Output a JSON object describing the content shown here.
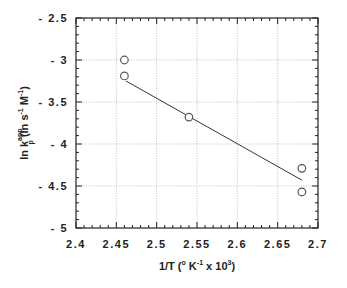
{
  "chart_data": {
    "type": "scatter",
    "title": "",
    "xlabel": "1/T (° K^-1 x 10^3)",
    "ylabel": "ln k_p^app (ln s^-1 M^-1)",
    "xlim": [
      2.4,
      2.7
    ],
    "ylim": [
      -5,
      -2.5
    ],
    "x_ticks": [
      2.4,
      2.45,
      2.5,
      2.55,
      2.6,
      2.65,
      2.7
    ],
    "x_tick_labels": [
      "2.4",
      "2.45",
      "2.5",
      "2.55",
      "2.6",
      "2.65",
      "2.7"
    ],
    "y_ticks": [
      -2.5,
      -3,
      -3.5,
      -4,
      -4.5,
      -5
    ],
    "y_tick_labels": [
      "- 2.5",
      "- 3",
      "- 3.5",
      "- 4",
      "- 4.5",
      "- 5"
    ],
    "grid": true,
    "legend": null,
    "series": [
      {
        "name": "data",
        "marker": "open-circle",
        "x": [
          2.46,
          2.46,
          2.54,
          2.68,
          2.68
        ],
        "y": [
          -3.0,
          -3.19,
          -3.68,
          -4.29,
          -4.57
        ]
      },
      {
        "name": "linear fit",
        "style": "line",
        "x": [
          2.462,
          2.68
        ],
        "y": [
          -3.25,
          -4.43
        ]
      }
    ]
  },
  "axes": {
    "x_title_parts": [
      "1/T  (",
      "o",
      " K",
      "-1",
      "  x  10",
      "3",
      ")"
    ],
    "y_title_parts": [
      "ln  k",
      "app",
      "p",
      "  (ln  s",
      "-1",
      " M",
      "-1",
      ")"
    ]
  },
  "colors": {
    "axis": "#222222",
    "grid": "#999999",
    "marker": "#555555",
    "line": "#333333"
  }
}
